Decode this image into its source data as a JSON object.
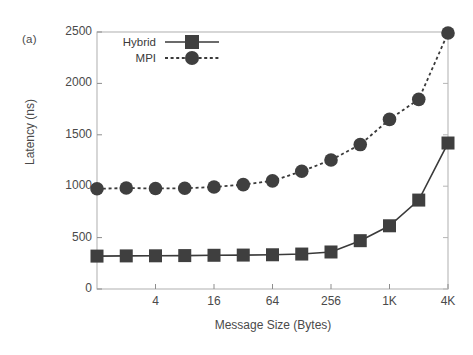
{
  "figure": {
    "panel_label": "(a)",
    "background": "#ffffff",
    "ink_color": "#4a4a4a"
  },
  "chart_data": {
    "type": "line",
    "title": "",
    "panel": "(a)",
    "xlabel": "Message Size (Bytes)",
    "ylabel": "Latency (ns)",
    "xscale": "log2",
    "xlim": [
      1,
      4096
    ],
    "ylim": [
      0,
      2500
    ],
    "grid": false,
    "legend_position": "upper left",
    "x": [
      1,
      2,
      4,
      8,
      16,
      32,
      64,
      128,
      256,
      512,
      1024,
      2048,
      4096
    ],
    "xtick_values": [
      4,
      16,
      64,
      256,
      1024,
      4096
    ],
    "xtick_labels": [
      "4",
      "16",
      "64",
      "256",
      "1K",
      "4K"
    ],
    "ytick_values": [
      0,
      500,
      1000,
      1500,
      2000,
      2500
    ],
    "ytick_labels": [
      "0",
      "500",
      "1000",
      "1500",
      "2000",
      "2500"
    ],
    "series": [
      {
        "name": "Hybrid",
        "marker": "square",
        "linestyle": "solid",
        "color": "#3a3a3a",
        "values": [
          320,
          322,
          323,
          325,
          328,
          330,
          333,
          340,
          360,
          470,
          615,
          865,
          1420
        ]
      },
      {
        "name": "MPI",
        "marker": "circle",
        "linestyle": "dotted",
        "color": "#3a3a3a",
        "values": [
          975,
          982,
          978,
          980,
          992,
          1015,
          1052,
          1145,
          1255,
          1405,
          1650,
          1845,
          2490
        ]
      }
    ]
  }
}
